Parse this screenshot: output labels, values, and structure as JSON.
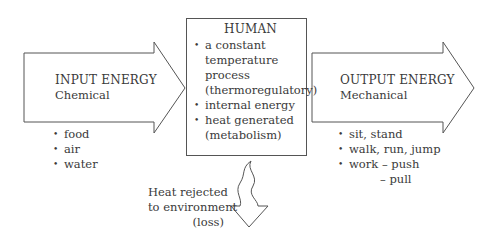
{
  "diagram": {
    "input": {
      "title": "INPUT ENERGY",
      "subtitle": "Chemical",
      "items": [
        "food",
        "air",
        "water"
      ]
    },
    "human": {
      "title": "HUMAN",
      "items": [
        {
          "lines": [
            "a constant",
            "temperature",
            "process",
            "(thermoregulatory)"
          ]
        },
        {
          "lines": [
            "internal energy"
          ]
        },
        {
          "lines": [
            "heat generated",
            "(metabolism)"
          ]
        }
      ]
    },
    "output": {
      "title": "OUTPUT ENERGY",
      "subtitle": "Mechanical",
      "items": [
        "sit, stand",
        "walk, run, jump",
        "work – push"
      ],
      "continuation": "– pull"
    },
    "heat_loss": {
      "lines": [
        "Heat rejected",
        "to environment",
        "(loss)"
      ]
    },
    "colors": {
      "stroke": "#555555",
      "text": "#3a3a3a",
      "background": "#ffffff"
    }
  }
}
